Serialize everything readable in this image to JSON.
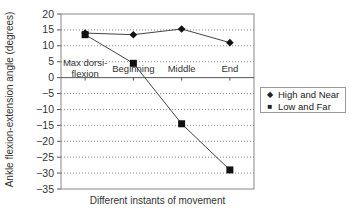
{
  "chart_data": {
    "type": "line",
    "title": "",
    "xlabel": "Different instants of movement",
    "ylabel": "Ankle flexion-extension angle (degrees)",
    "categories": [
      "Max dorsi-flexion",
      "Beginning",
      "Middle",
      "End"
    ],
    "category_lines": [
      [
        "Max dorsi-",
        "flexion"
      ],
      [
        "Beginning"
      ],
      [
        "Middle"
      ],
      [
        "End"
      ]
    ],
    "ylim": [
      -35,
      20
    ],
    "yticks": [
      20,
      15,
      10,
      5,
      0,
      -5,
      -10,
      -15,
      -20,
      -25,
      -30,
      -35
    ],
    "grid": "horizontal dotted",
    "legend_position": "right",
    "series": [
      {
        "name": "High and Near",
        "marker": "diamond",
        "values": [
          14,
          13.5,
          15.3,
          11
        ]
      },
      {
        "name": "Low and Far",
        "marker": "square",
        "values": [
          13.5,
          4.5,
          -14.5,
          -29
        ]
      }
    ]
  },
  "legend": {
    "items": [
      {
        "label": "High and Near",
        "marker": "◆"
      },
      {
        "label": "Low and Far",
        "marker": "■"
      }
    ]
  }
}
